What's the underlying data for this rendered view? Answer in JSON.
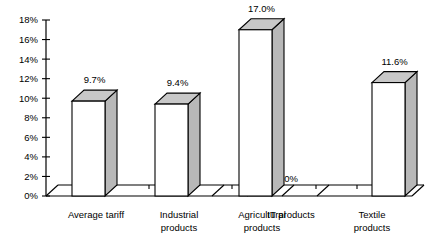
{
  "chart_data": {
    "type": "bar",
    "title": "",
    "xlabel": "",
    "ylabel": "",
    "categories": [
      "Average tariff",
      "Industrial products",
      "Agricultural products",
      "IT products",
      "Textile products"
    ],
    "category_lines": [
      [
        "Average tariff"
      ],
      [
        "Industrial",
        "products"
      ],
      [
        "Agricultural",
        "products"
      ],
      [
        "IT products"
      ],
      [
        "Textile",
        "products"
      ]
    ],
    "values": [
      9.7,
      9.4,
      17.0,
      0,
      11.6
    ],
    "value_labels": [
      "9.7%",
      "9.4%",
      "17.0%",
      "0%",
      "11.6%"
    ],
    "ylim": [
      0,
      18
    ],
    "ytick_values": [
      0,
      2,
      4,
      6,
      8,
      10,
      12,
      14,
      16,
      18
    ],
    "ytick_labels": [
      "0%",
      "2%",
      "4%",
      "6%",
      "8%",
      "10%",
      "12%",
      "14%",
      "16%",
      "18%"
    ],
    "grid": false,
    "legend": null,
    "style": "3d-column",
    "colors": {
      "bar_front": "#ffffff",
      "bar_side": "#b8b8b8",
      "bar_top": "#c8c8c8",
      "outline": "#000000",
      "background": "#ffffff",
      "text": "#000000"
    }
  }
}
